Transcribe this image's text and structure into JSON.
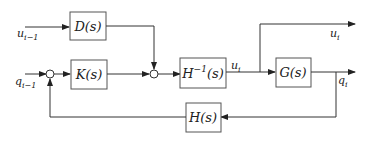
{
  "diagram": {
    "type": "block-diagram",
    "blocks": [
      {
        "id": "D",
        "label": "D(s)"
      },
      {
        "id": "K",
        "label": "K(s)"
      },
      {
        "id": "Hinv",
        "label": "H",
        "sup": "−1",
        "suffix": "(s)"
      },
      {
        "id": "G",
        "label": "G(s)"
      },
      {
        "id": "H",
        "label": "H(s)"
      }
    ],
    "signals": {
      "u_prev": {
        "base": "u",
        "sub": "i−1"
      },
      "q_prev": {
        "base": "q",
        "sub": "i−1"
      },
      "u_mid": {
        "base": "u",
        "sub": "i"
      },
      "u_out": {
        "base": "u",
        "sub": "i"
      },
      "q_out": {
        "base": "q",
        "sub": "i"
      }
    },
    "colors": {
      "line": "#333333",
      "block_border": "#555555",
      "text": "#222222",
      "background": "#ffffff"
    }
  }
}
